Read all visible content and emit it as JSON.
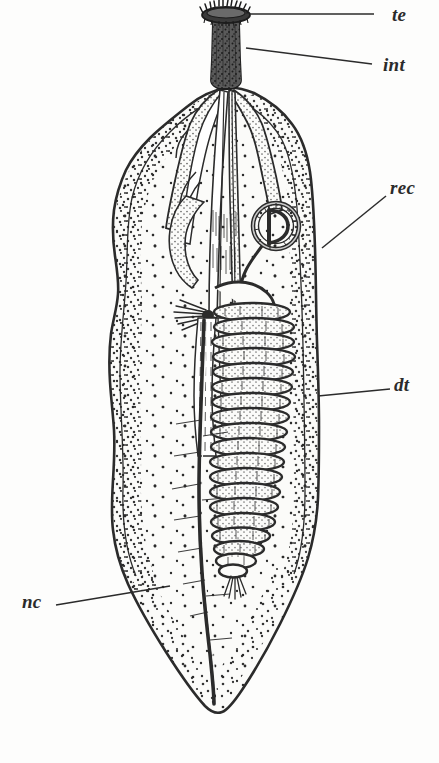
{
  "figure": {
    "background_color": "#fdfdfc",
    "ink_color": "#2b2b2b",
    "width": 439,
    "height": 763
  },
  "labels": [
    {
      "id": "te",
      "text": "te",
      "meaning": "tentacles",
      "text_x": 392,
      "text_y": 5,
      "leader": {
        "x1": 250,
        "y1": 14,
        "x2": 374,
        "y2": 14
      }
    },
    {
      "id": "int",
      "text": "int",
      "meaning": "introvert",
      "text_x": 383,
      "text_y": 55,
      "leader": {
        "x1": 246,
        "y1": 48,
        "x2": 372,
        "y2": 64
      }
    },
    {
      "id": "rec",
      "text": "rec",
      "meaning": "rectum",
      "text_x": 390,
      "text_y": 178,
      "leader": {
        "x1": 322,
        "y1": 248,
        "x2": 386,
        "y2": 196
      }
    },
    {
      "id": "dt",
      "text": "dt",
      "meaning": "digestive tract",
      "text_x": 394,
      "text_y": 375,
      "leader": {
        "x1": 318,
        "y1": 396,
        "x2": 390,
        "y2": 389
      }
    },
    {
      "id": "nc",
      "text": "nc",
      "meaning": "nerve cord",
      "text_x": 22,
      "text_y": 592,
      "leader": {
        "x1": 56,
        "y1": 605,
        "x2": 170,
        "y2": 586
      }
    }
  ],
  "structures": {
    "tentacle_crown": {
      "name": "tentacle-crown",
      "center_x": 226,
      "center_y": 14,
      "width": 46,
      "height": 16
    },
    "introvert": {
      "name": "introvert-proboscis",
      "top_y": 20,
      "bottom_y": 86,
      "center_x": 226,
      "width": 26
    },
    "esophagus": {
      "name": "esophagus-bundle",
      "top_y": 88,
      "bottom_y": 320
    },
    "rectum_loop": {
      "name": "rectum-loop",
      "center_x": 276,
      "center_y": 226,
      "radius": 23
    },
    "digestive_coil": {
      "name": "digestive-tract-coil",
      "top_y": 300,
      "bottom_y": 570,
      "loops": 19,
      "center_x": 252
    },
    "nerve_cord": {
      "name": "nerve-cord",
      "top_y": 320,
      "bottom_y": 706,
      "center_x": 205
    },
    "body_wall": {
      "name": "body-wall-outline",
      "top_y": 86,
      "bottom_y": 712,
      "left_x": 108,
      "right_x": 320
    }
  }
}
